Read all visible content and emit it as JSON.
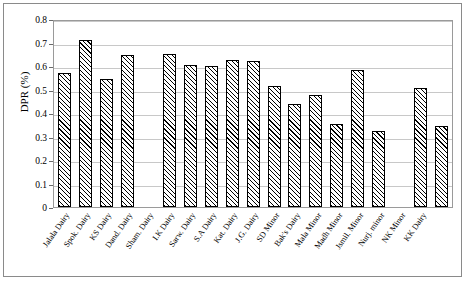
{
  "chart_data": {
    "type": "bar",
    "title": "",
    "xlabel": "",
    "ylabel": "DPR (%)",
    "ylim": [
      0,
      0.8
    ],
    "ytick_labels": [
      "0",
      "0.1",
      "0.2",
      "0.3",
      "0.4",
      "0.5",
      "0.6",
      "0.7",
      "0.8"
    ],
    "ytick_values": [
      0,
      0.1,
      0.2,
      0.3,
      0.4,
      0.5,
      0.6,
      0.7,
      0.8
    ],
    "grid": true,
    "legend": "none",
    "categories": [
      "Jalala Dairy",
      "Spok. Dairy",
      "KS Dairy",
      "Dand. Dairy",
      "Sham. Dairy",
      "I.K Dairy",
      "Sarw. Dairy",
      "S.A Dairy",
      "Kat. Dairy",
      "J.G. Dairy",
      "SD Minor",
      "Bak's Dairy",
      "Mala Minor",
      "Madh Minor",
      "Jsmil. Minor",
      "Nurj. minor",
      "NK Minor",
      "KK Dairy"
    ],
    "values": [
      0.57,
      0.71,
      0.545,
      0.645,
      0.0,
      0.65,
      0.605,
      0.6,
      0.625,
      0.62,
      0.515,
      0.44,
      0.475,
      0.355,
      0.585,
      0.325,
      0.0,
      0.505
    ],
    "values_visible": [
      0.57,
      0.71,
      0.545,
      0.645,
      null,
      0.65,
      0.605,
      0.6,
      0.625,
      0.62,
      0.515,
      0.44,
      0.475,
      0.355,
      0.585,
      0.325,
      null,
      0.505
    ],
    "note": "Bars for 'Sham. Dairy' and 'NK Minor' categories are absent; the last drawn bar (0.345) sits under 'KK Dairy' position"
  },
  "extra_bars": {
    "trailing_value": 0.345
  }
}
